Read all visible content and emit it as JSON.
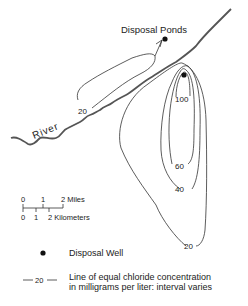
{
  "map": {
    "labels": {
      "disposal_ponds": "Disposal Ponds",
      "river": "River"
    },
    "contours": [
      {
        "value": "20",
        "label": "20",
        "location": "plume-northwest"
      },
      {
        "value": "100",
        "label": "100"
      },
      {
        "value": "60",
        "label": "60"
      },
      {
        "value": "40",
        "label": "40"
      },
      {
        "value": "20",
        "label": "20",
        "location": "plume-south"
      }
    ],
    "scale_bar": {
      "miles_ticks": [
        "0",
        "1",
        "2 Miles"
      ],
      "km_ticks": [
        "0",
        "1",
        "2 Kilometers"
      ]
    }
  },
  "legend": {
    "well_label": "Disposal Well",
    "contour_sample": "20",
    "contour_line1": "Line of equal chloride concentration",
    "contour_line2": "in milligrams per liter: interval varies"
  }
}
